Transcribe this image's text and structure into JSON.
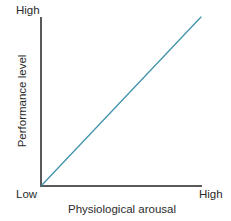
{
  "chart_data": {
    "type": "line",
    "title": "",
    "subtitle": "",
    "xlabel": "Physiological arousal",
    "ylabel": "Performance level",
    "x_tick_labels": [
      "Low",
      "High"
    ],
    "y_tick_labels": [
      "Low",
      "High"
    ],
    "grid": false,
    "legend": null,
    "xlim": [
      0,
      1
    ],
    "ylim": [
      0,
      1
    ],
    "series": [
      {
        "name": "Performance",
        "color": "#3f93ab",
        "x": [
          0,
          1
        ],
        "values": [
          0,
          1
        ]
      }
    ],
    "annotations": [],
    "axis_color": "#595959",
    "text_color": "#2b2b2b",
    "background": "#ffffff"
  },
  "labels": {
    "y_axis_title": "Performance level",
    "x_axis_title": "Physiological arousal",
    "y_top": "High",
    "y_bottom": "Low",
    "x_right": "High"
  },
  "geometry": {
    "origin_x": 41,
    "origin_y": 186,
    "x_axis_end": 202,
    "y_axis_top": 17,
    "line_end_x": 201,
    "line_end_y": 17
  }
}
